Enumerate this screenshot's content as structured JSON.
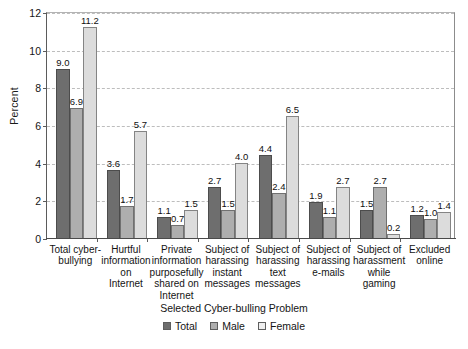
{
  "chart_data": {
    "type": "bar",
    "title": "",
    "subtitle": "",
    "xlabel": "Selected Cyber-bulling Problem",
    "ylabel": "Percent",
    "ylim": [
      0,
      12
    ],
    "yticks": [
      0,
      2,
      4,
      6,
      8,
      10,
      12
    ],
    "ytick_labels": [
      "0",
      "2",
      "4",
      "6",
      "8",
      "10",
      "12"
    ],
    "grid": "horizontal-dashed",
    "legend_position": "bottom-center",
    "categories": [
      "Total cyber-bullying",
      "Hurtful information on Internet",
      "Private information purposefully shared on Internet",
      "Subject of harassing instant messages",
      "Subject of harassing text messages",
      "Subject of harassing e-mails",
      "Subject of harassment while gaming",
      "Excluded online"
    ],
    "category_lines": [
      [
        "Total cyber-",
        "bullying"
      ],
      [
        "Hurtful",
        "information",
        "on",
        "Internet"
      ],
      [
        "Private",
        "information",
        "purposefully",
        "shared on",
        "Internet"
      ],
      [
        "Subject of",
        "harassing",
        "instant",
        "messages"
      ],
      [
        "Subject of",
        "harassing",
        "text",
        "messages"
      ],
      [
        "Subject of",
        "harassing",
        "e-mails"
      ],
      [
        "Subject of",
        "harassment",
        "while",
        "gaming"
      ],
      [
        "Excluded",
        "online"
      ]
    ],
    "series": [
      {
        "name": "Total",
        "color": "#6e6e6e",
        "values": [
          9.0,
          3.6,
          1.1,
          2.7,
          4.4,
          1.9,
          1.5,
          1.2
        ],
        "labels": [
          "9.0",
          "3.6",
          "1.1",
          "2.7",
          "4.4",
          "1.9",
          "1.5",
          "1.2"
        ]
      },
      {
        "name": "Male",
        "color": "#aeaeae",
        "values": [
          6.9,
          1.7,
          0.7,
          1.5,
          2.4,
          1.1,
          2.7,
          1.0
        ],
        "labels": [
          "6.9",
          "1.7",
          "0.7",
          "1.5",
          "2.4",
          "1.1",
          "2.7",
          "1.0"
        ]
      },
      {
        "name": "Female",
        "color": "#dcdcdc",
        "values": [
          11.2,
          5.7,
          1.5,
          4.0,
          6.5,
          2.7,
          0.2,
          1.4
        ],
        "labels": [
          "11.2",
          "5.7",
          "1.5",
          "4.0",
          "6.5",
          "2.7",
          "0.2",
          "1.4"
        ]
      }
    ]
  },
  "legend": {
    "items": [
      {
        "label": "Total"
      },
      {
        "label": "Male"
      },
      {
        "label": "Female"
      }
    ]
  }
}
